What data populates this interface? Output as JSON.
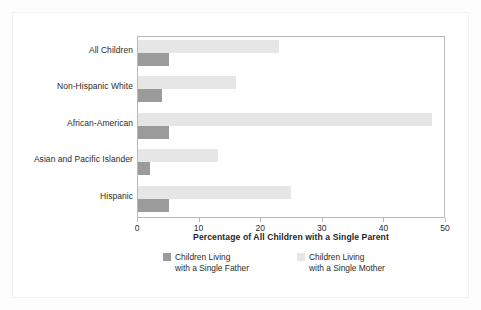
{
  "chart_data": {
    "type": "bar",
    "orientation": "horizontal",
    "title": "",
    "xlabel": "Percentage of All Children with a Single Parent",
    "ylabel": "",
    "xlim": [
      0,
      50
    ],
    "xticks": [
      0,
      10,
      20,
      30,
      40,
      50
    ],
    "xtick_labels": [
      "0",
      "10",
      "20",
      "30",
      "40",
      "50"
    ],
    "grid": false,
    "legend_position": "bottom",
    "categories": [
      "All Children",
      "Non-Hispanic White",
      "African-American",
      "Asian and Pacific Islander",
      "Hispanic"
    ],
    "series": [
      {
        "name": "Children Living with a Single Father",
        "color": "#9b9b9b",
        "values": [
          5,
          4,
          5,
          2,
          5
        ]
      },
      {
        "name": "Children Living with a Single Mother",
        "color": "#e6e6e6",
        "values": [
          23,
          16,
          48,
          13,
          25
        ]
      }
    ]
  },
  "axis": {
    "x_title": "Percentage of All Children with a Single Parent",
    "tick_labels": [
      "0",
      "10",
      "20",
      "30",
      "40",
      "50"
    ]
  },
  "categories": [
    {
      "label": "All Children"
    },
    {
      "label": "Non-Hispanic White"
    },
    {
      "label": "African-American"
    },
    {
      "label": "Asian and Pacific Islander"
    },
    {
      "label": "Hispanic"
    }
  ],
  "legend": {
    "father": {
      "line1": "Children Living",
      "line2": "with a Single Father",
      "color": "#9b9b9b"
    },
    "mother": {
      "line1": "Children Living",
      "line2": "with a Single Mother",
      "color": "#e6e6e6"
    }
  }
}
